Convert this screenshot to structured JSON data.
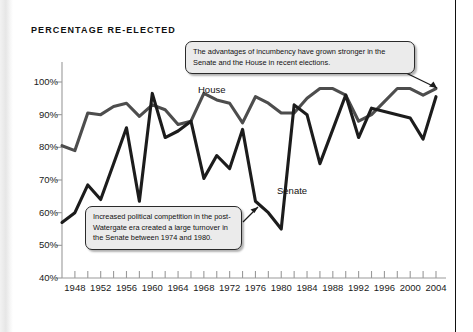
{
  "figure": {
    "title": "PERCENTAGE RE-ELECTED"
  },
  "annotations": {
    "top": "The advantages of incumbency have grown stronger in the Senate and the House in recent elections.",
    "bottom": "Increased political competition in the post-Watergate era created a large turnover in the Senate between 1974 and 1980."
  },
  "series_labels": {
    "house": "House",
    "senate": "Senate"
  },
  "axis": {
    "y_ticks": [
      "100%",
      "90%",
      "80%",
      "70%",
      "60%",
      "50%",
      "40%"
    ],
    "x_ticks": [
      "1948",
      "1952",
      "1956",
      "1960",
      "1964",
      "1968",
      "1972",
      "1976",
      "1980",
      "1984",
      "1988",
      "1992",
      "1996",
      "2000",
      "2004"
    ]
  },
  "colors": {
    "house_line": "#4d4d4d",
    "senate_line": "#1c1c1c",
    "axis": "#9a9a9a",
    "callout_bg": "#ebebeb",
    "callout_border": "#2a2a2a",
    "page_background": "#ffffff"
  },
  "chart_data": {
    "type": "line",
    "title": "PERCENTAGE RE-ELECTED",
    "xlabel": "",
    "ylabel": "",
    "ylim": [
      40,
      100
    ],
    "xlim": [
      1946,
      2004
    ],
    "grid": false,
    "legend": "inline-labels",
    "x": [
      1946,
      1948,
      1950,
      1952,
      1954,
      1956,
      1958,
      1960,
      1962,
      1964,
      1966,
      1968,
      1970,
      1972,
      1974,
      1976,
      1978,
      1980,
      1982,
      1984,
      1986,
      1988,
      1990,
      1992,
      1994,
      1996,
      1998,
      2000,
      2002,
      2004
    ],
    "series": [
      {
        "name": "House",
        "values": [
          80.5,
          79.0,
          90.5,
          90.0,
          92.5,
          93.5,
          89.5,
          93.0,
          91.5,
          87.0,
          88.0,
          96.5,
          94.5,
          93.5,
          87.5,
          95.5,
          93.5,
          90.5,
          90.5,
          95.0,
          98.0,
          98.0,
          96.0,
          88.0,
          90.0,
          94.0,
          98.0,
          98.0,
          96.0,
          98.0
        ]
      },
      {
        "name": "Senate",
        "values": [
          57.0,
          60.0,
          68.5,
          64.0,
          75.0,
          86.0,
          63.5,
          96.5,
          83.0,
          85.0,
          88.0,
          70.5,
          77.5,
          73.5,
          85.5,
          63.5,
          60.0,
          55.0,
          93.0,
          90.0,
          75.0,
          85.5,
          96.0,
          83.0,
          92.0,
          91.0,
          90.0,
          89.0,
          82.5,
          95.5
        ]
      }
    ],
    "annotations": [
      {
        "text": "The advantages of incumbency have grown stronger in the Senate and the House in recent elections.",
        "points_to": "2004 end of both lines"
      },
      {
        "text": "Increased political competition in the post-Watergate era created a large turnover in the Senate between 1974 and 1980.",
        "points_to": "1976-1980 Senate trough"
      }
    ]
  }
}
